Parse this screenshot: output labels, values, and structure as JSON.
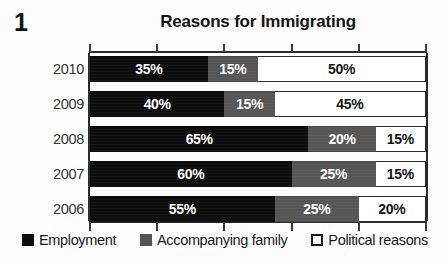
{
  "figure": {
    "number": "1",
    "title": "Reasons for Immigrating"
  },
  "legend": {
    "items": [
      {
        "label": "Employment",
        "swatch": "employment-swatch-icon",
        "color": "#0d0d0d"
      },
      {
        "label": "Accompanying family",
        "swatch": "family-swatch-icon",
        "color": "#555555"
      },
      {
        "label": "Political reasons",
        "swatch": "political-swatch-icon",
        "color": "#ffffff"
      }
    ]
  },
  "axis": {
    "tick_labels": [
      "0%",
      "20%",
      "40%",
      "60%",
      "80%",
      "100%"
    ]
  },
  "rows": [
    {
      "year": "2010",
      "employment": "35%",
      "family": "15%",
      "political": "50%"
    },
    {
      "year": "2009",
      "employment": "40%",
      "family": "15%",
      "political": "45%"
    },
    {
      "year": "2008",
      "employment": "65%",
      "family": "20%",
      "political": "15%"
    },
    {
      "year": "2007",
      "employment": "60%",
      "family": "25%",
      "political": "15%"
    },
    {
      "year": "2006",
      "employment": "55%",
      "family": "25%",
      "political": "20%"
    }
  ],
  "chart_data": {
    "type": "bar",
    "orientation": "horizontal",
    "stacked": true,
    "normalized_percent": true,
    "title": "Reasons for Immigrating",
    "xlabel": "",
    "ylabel": "",
    "xlim": [
      0,
      100
    ],
    "grid": false,
    "legend_position": "bottom",
    "categories": [
      "2010",
      "2009",
      "2008",
      "2007",
      "2006"
    ],
    "series": [
      {
        "name": "Employment",
        "color": "#0d0d0d",
        "values": [
          35,
          40,
          65,
          60,
          55
        ]
      },
      {
        "name": "Accompanying family",
        "color": "#555555",
        "values": [
          15,
          15,
          20,
          25,
          25
        ]
      },
      {
        "name": "Political reasons",
        "color": "#ffffff",
        "values": [
          50,
          45,
          15,
          15,
          20
        ]
      }
    ],
    "data_labels": [
      [
        "35%",
        "15%",
        "50%"
      ],
      [
        "40%",
        "15%",
        "45%"
      ],
      [
        "65%",
        "20%",
        "15%"
      ],
      [
        "60%",
        "25%",
        "15%"
      ],
      [
        "55%",
        "25%",
        "20%"
      ]
    ],
    "axis_ticks": [
      0,
      20,
      40,
      60,
      80,
      100
    ]
  }
}
